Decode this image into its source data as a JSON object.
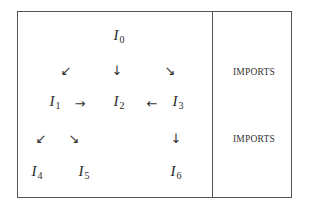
{
  "diagram": {
    "nodes": [
      {
        "id": "I0",
        "base": "I",
        "sub": "0"
      },
      {
        "id": "I1",
        "base": "I",
        "sub": "1"
      },
      {
        "id": "I2",
        "base": "I",
        "sub": "2"
      },
      {
        "id": "I3",
        "base": "I",
        "sub": "3"
      },
      {
        "id": "I4",
        "base": "I",
        "sub": "4"
      },
      {
        "id": "I5",
        "base": "I",
        "sub": "5"
      },
      {
        "id": "I6",
        "base": "I",
        "sub": "6"
      }
    ],
    "arrows": [
      {
        "from": "I0",
        "to": "I1",
        "glyph": "↙"
      },
      {
        "from": "I0",
        "to": "I2",
        "glyph": "↓"
      },
      {
        "from": "I0",
        "to": "I3",
        "glyph": "↘"
      },
      {
        "from": "I1",
        "to": "I2",
        "glyph": "→"
      },
      {
        "from": "I3",
        "to": "I2",
        "glyph": "←"
      },
      {
        "from": "I1",
        "to": "I4",
        "glyph": "↙"
      },
      {
        "from": "I1",
        "to": "I5",
        "glyph": "↘"
      },
      {
        "from": "I3",
        "to": "I6",
        "glyph": "↓"
      }
    ],
    "side_labels": [
      "IMPORTS",
      "IMPORTS"
    ]
  }
}
